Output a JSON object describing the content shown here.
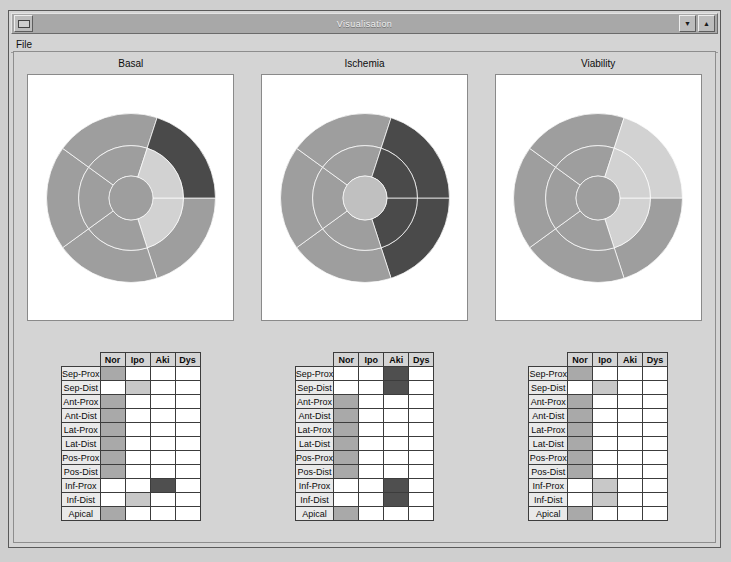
{
  "window": {
    "title": "Visualisation",
    "sysmenu_icon": "system-menu-icon",
    "minimize_label": "▼",
    "maximize_label": "▲"
  },
  "menubar": {
    "items": [
      {
        "label": "File"
      }
    ]
  },
  "panels": [
    {
      "title": "Basal"
    },
    {
      "title": "Ischemia"
    },
    {
      "title": "Viability"
    }
  ],
  "legend_colors": {
    "nor": "#a9a9a9",
    "ipo": "#c8c8c8",
    "aki": "#4f4f4f",
    "dys": "#2a2a2a",
    "empty": "#ffffff",
    "panel_bg": "#ffffff",
    "window_bg": "#d4d4d4",
    "titlebar_bg": "#a8a8a8"
  },
  "tables": {
    "columns": [
      "Nor",
      "Ipo",
      "Aki",
      "Dys"
    ],
    "rows": [
      "Sep-Prox",
      "Sep-Dist",
      "Ant-Prox",
      "Ant-Dist",
      "Lat-Prox",
      "Lat-Dist",
      "Pos-Prox",
      "Pos-Dist",
      "Inf-Prox",
      "Inf-Dist",
      "Apical"
    ],
    "datasets": [
      {
        "name": "Basal",
        "values": [
          "Nor",
          "Ipo",
          "Nor",
          "Nor",
          "Nor",
          "Nor",
          "Nor",
          "Nor",
          "Aki",
          "Ipo",
          "Nor"
        ]
      },
      {
        "name": "Ischemia",
        "values": [
          "Aki",
          "Aki",
          "Nor",
          "Nor",
          "Nor",
          "Nor",
          "Nor",
          "Nor",
          "Aki",
          "Aki",
          "Nor"
        ]
      },
      {
        "name": "Viability",
        "values": [
          "Nor",
          "Ipo",
          "Nor",
          "Nor",
          "Nor",
          "Nor",
          "Nor",
          "Nor",
          "Ipo",
          "Ipo",
          "Nor"
        ]
      }
    ]
  },
  "chart_data": [
    {
      "type": "pie",
      "title": "Basal",
      "subtitle": "",
      "xlabel": "",
      "ylabel": "",
      "legend_position": "none",
      "grid": false,
      "description": "Polar bullseye plot of 11 left-ventricular segments, 3 concentric rings",
      "rings": [
        {
          "ring": "proximal",
          "r_inner": 0.62,
          "r_outer": 1.0,
          "segments": [
            {
              "label": "Sep-Prox",
              "start_deg": 90,
              "end_deg": 162,
              "value": "Nor",
              "color": "#9e9e9e"
            },
            {
              "label": "Ant-Prox",
              "start_deg": 162,
              "end_deg": 234,
              "value": "Nor",
              "color": "#9e9e9e"
            },
            {
              "label": "Lat-Prox",
              "start_deg": 234,
              "end_deg": 306,
              "value": "Nor",
              "color": "#9e9e9e"
            },
            {
              "label": "Pos-Prox",
              "start_deg": 306,
              "end_deg": 18,
              "value": "Nor",
              "color": "#9e9e9e"
            },
            {
              "label": "Inf-Prox",
              "start_deg": 18,
              "end_deg": 90,
              "value": "Aki",
              "color": "#4a4a4a"
            }
          ]
        },
        {
          "ring": "distal",
          "r_inner": 0.26,
          "r_outer": 0.62,
          "segments": [
            {
              "label": "Sep-Dist",
              "start_deg": 90,
              "end_deg": 162,
              "value": "Ipo",
              "color": "#d2d2d2"
            },
            {
              "label": "Ant-Dist",
              "start_deg": 162,
              "end_deg": 234,
              "value": "Nor",
              "color": "#9e9e9e"
            },
            {
              "label": "Lat-Dist",
              "start_deg": 234,
              "end_deg": 306,
              "value": "Nor",
              "color": "#9e9e9e"
            },
            {
              "label": "Pos-Dist",
              "start_deg": 306,
              "end_deg": 18,
              "value": "Nor",
              "color": "#9e9e9e"
            },
            {
              "label": "Inf-Dist",
              "start_deg": 18,
              "end_deg": 90,
              "value": "Ipo",
              "color": "#d2d2d2"
            }
          ]
        },
        {
          "ring": "apical",
          "r_inner": 0.0,
          "r_outer": 0.26,
          "segments": [
            {
              "label": "Apical",
              "start_deg": 0,
              "end_deg": 360,
              "value": "Nor",
              "color": "#9e9e9e"
            }
          ]
        }
      ]
    },
    {
      "type": "pie",
      "title": "Ischemia",
      "subtitle": "",
      "xlabel": "",
      "ylabel": "",
      "legend_position": "none",
      "grid": false,
      "description": "Polar bullseye plot of 11 left-ventricular segments, 3 concentric rings",
      "rings": [
        {
          "ring": "proximal",
          "r_inner": 0.62,
          "r_outer": 1.0,
          "segments": [
            {
              "label": "Sep-Prox",
              "start_deg": 90,
              "end_deg": 162,
              "value": "Aki",
              "color": "#4a4a4a"
            },
            {
              "label": "Ant-Prox",
              "start_deg": 162,
              "end_deg": 234,
              "value": "Nor",
              "color": "#9e9e9e"
            },
            {
              "label": "Lat-Prox",
              "start_deg": 234,
              "end_deg": 306,
              "value": "Nor",
              "color": "#9e9e9e"
            },
            {
              "label": "Pos-Prox",
              "start_deg": 306,
              "end_deg": 18,
              "value": "Nor",
              "color": "#9e9e9e"
            },
            {
              "label": "Inf-Prox",
              "start_deg": 18,
              "end_deg": 90,
              "value": "Aki",
              "color": "#4a4a4a"
            }
          ]
        },
        {
          "ring": "distal",
          "r_inner": 0.26,
          "r_outer": 0.62,
          "segments": [
            {
              "label": "Sep-Dist",
              "start_deg": 90,
              "end_deg": 162,
              "value": "Aki",
              "color": "#4a4a4a"
            },
            {
              "label": "Ant-Dist",
              "start_deg": 162,
              "end_deg": 234,
              "value": "Nor",
              "color": "#9e9e9e"
            },
            {
              "label": "Lat-Dist",
              "start_deg": 234,
              "end_deg": 306,
              "value": "Nor",
              "color": "#9e9e9e"
            },
            {
              "label": "Pos-Dist",
              "start_deg": 306,
              "end_deg": 18,
              "value": "Nor",
              "color": "#9e9e9e"
            },
            {
              "label": "Inf-Dist",
              "start_deg": 18,
              "end_deg": 90,
              "value": "Aki",
              "color": "#4a4a4a"
            }
          ]
        },
        {
          "ring": "apical",
          "r_inner": 0.0,
          "r_outer": 0.26,
          "segments": [
            {
              "label": "Apical",
              "start_deg": 0,
              "end_deg": 360,
              "value": "Nor",
              "color": "#c0c0c0"
            }
          ]
        }
      ]
    },
    {
      "type": "pie",
      "title": "Viability",
      "subtitle": "",
      "xlabel": "",
      "ylabel": "",
      "legend_position": "none",
      "grid": false,
      "description": "Polar bullseye plot of 11 left-ventricular segments, 3 concentric rings",
      "rings": [
        {
          "ring": "proximal",
          "r_inner": 0.62,
          "r_outer": 1.0,
          "segments": [
            {
              "label": "Sep-Prox",
              "start_deg": 90,
              "end_deg": 162,
              "value": "Nor",
              "color": "#9e9e9e"
            },
            {
              "label": "Ant-Prox",
              "start_deg": 162,
              "end_deg": 234,
              "value": "Nor",
              "color": "#9e9e9e"
            },
            {
              "label": "Lat-Prox",
              "start_deg": 234,
              "end_deg": 306,
              "value": "Nor",
              "color": "#9e9e9e"
            },
            {
              "label": "Pos-Prox",
              "start_deg": 306,
              "end_deg": 18,
              "value": "Nor",
              "color": "#9e9e9e"
            },
            {
              "label": "Inf-Prox",
              "start_deg": 18,
              "end_deg": 90,
              "value": "Ipo",
              "color": "#d2d2d2"
            }
          ]
        },
        {
          "ring": "distal",
          "r_inner": 0.26,
          "r_outer": 0.62,
          "segments": [
            {
              "label": "Sep-Dist",
              "start_deg": 90,
              "end_deg": 162,
              "value": "Ipo",
              "color": "#d2d2d2"
            },
            {
              "label": "Ant-Dist",
              "start_deg": 162,
              "end_deg": 234,
              "value": "Nor",
              "color": "#9e9e9e"
            },
            {
              "label": "Lat-Dist",
              "start_deg": 234,
              "end_deg": 306,
              "value": "Nor",
              "color": "#9e9e9e"
            },
            {
              "label": "Pos-Dist",
              "start_deg": 306,
              "end_deg": 18,
              "value": "Nor",
              "color": "#9e9e9e"
            },
            {
              "label": "Inf-Dist",
              "start_deg": 18,
              "end_deg": 90,
              "value": "Ipo",
              "color": "#d2d2d2"
            }
          ]
        },
        {
          "ring": "apical",
          "r_inner": 0.0,
          "r_outer": 0.26,
          "segments": [
            {
              "label": "Apical",
              "start_deg": 0,
              "end_deg": 360,
              "value": "Nor",
              "color": "#9e9e9e"
            }
          ]
        }
      ]
    }
  ]
}
